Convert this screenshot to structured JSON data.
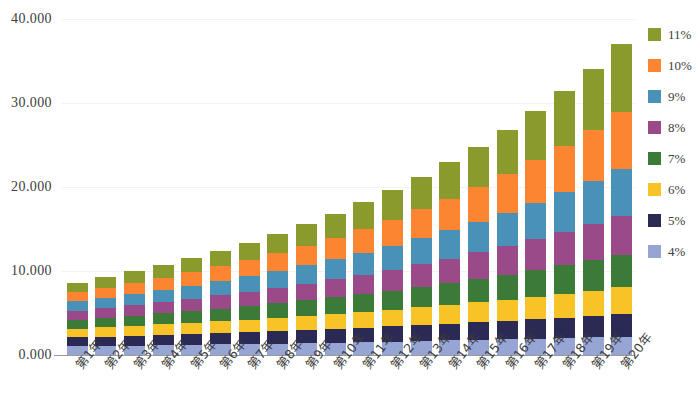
{
  "chart_data": {
    "type": "bar",
    "stacked": true,
    "title": "",
    "subtitle": "",
    "xlabel": "",
    "ylabel": "",
    "ylim": [
      0,
      40
    ],
    "ytick_values": [
      0,
      10,
      20,
      30,
      40
    ],
    "ytick_labels": [
      "0.000",
      "10.000",
      "20.000",
      "30.000",
      "40.000"
    ],
    "grid": true,
    "legend_position": "right",
    "categories": [
      "第1年",
      "第2年",
      "第3年",
      "第4年",
      "第5年",
      "第6年",
      "第7年",
      "第8年",
      "第9年",
      "第10年",
      "第11年",
      "第12年",
      "第13年",
      "第14年",
      "第15年",
      "第16年",
      "第17年",
      "第18年",
      "第19年",
      "第20年"
    ],
    "series": [
      {
        "name": "4%",
        "color": "#97a5d4",
        "values": [
          1.04,
          1.082,
          1.125,
          1.17,
          1.217,
          1.265,
          1.316,
          1.369,
          1.423,
          1.48,
          1.539,
          1.601,
          1.665,
          1.732,
          1.801,
          1.873,
          1.948,
          2.026,
          2.107,
          2.191
        ]
      },
      {
        "name": "5%",
        "color": "#2b2a55",
        "values": [
          1.05,
          1.103,
          1.158,
          1.216,
          1.276,
          1.34,
          1.407,
          1.477,
          1.551,
          1.629,
          1.71,
          1.796,
          1.886,
          1.98,
          2.079,
          2.183,
          2.292,
          2.407,
          2.527,
          2.653
        ]
      },
      {
        "name": "6%",
        "color": "#f7c327",
        "values": [
          1.06,
          1.124,
          1.191,
          1.262,
          1.338,
          1.419,
          1.504,
          1.594,
          1.689,
          1.791,
          1.898,
          2.012,
          2.133,
          2.261,
          2.397,
          2.54,
          2.693,
          2.854,
          3.026,
          3.207
        ]
      },
      {
        "name": "7%",
        "color": "#3c7a37",
        "values": [
          1.07,
          1.145,
          1.225,
          1.311,
          1.403,
          1.501,
          1.606,
          1.718,
          1.838,
          1.967,
          2.105,
          2.252,
          2.41,
          2.579,
          2.759,
          2.952,
          3.159,
          3.38,
          3.617,
          3.87
        ]
      },
      {
        "name": "8%",
        "color": "#9a4a89",
        "values": [
          1.08,
          1.166,
          1.26,
          1.36,
          1.469,
          1.587,
          1.714,
          1.851,
          1.999,
          2.159,
          2.332,
          2.518,
          2.72,
          2.937,
          3.172,
          3.426,
          3.7,
          3.996,
          4.316,
          4.661
        ]
      },
      {
        "name": "9%",
        "color": "#4a91b7",
        "values": [
          1.09,
          1.188,
          1.295,
          1.412,
          1.539,
          1.677,
          1.828,
          1.993,
          2.172,
          2.367,
          2.58,
          2.813,
          3.066,
          3.342,
          3.642,
          3.97,
          4.328,
          4.717,
          5.142,
          5.604
        ]
      },
      {
        "name": "10%",
        "color": "#fb8530",
        "values": [
          1.1,
          1.21,
          1.331,
          1.464,
          1.611,
          1.772,
          1.949,
          2.144,
          2.358,
          2.594,
          2.853,
          3.138,
          3.452,
          3.797,
          4.177,
          4.595,
          5.054,
          5.56,
          6.116,
          6.727
        ]
      },
      {
        "name": "11%",
        "color": "#8a9a2c",
        "values": [
          1.11,
          1.232,
          1.368,
          1.518,
          1.685,
          1.87,
          2.076,
          2.305,
          2.558,
          2.839,
          3.152,
          3.498,
          3.883,
          4.31,
          4.785,
          5.311,
          5.895,
          6.544,
          7.263,
          8.062
        ]
      }
    ],
    "totals": [
      8.6,
      9.25,
      9.953,
      10.713,
      11.538,
      12.431,
      13.4,
      14.451,
      15.588,
      16.826,
      18.169,
      19.628,
      21.215,
      22.938,
      24.812,
      26.85,
      29.069,
      31.484,
      34.114,
      36.975
    ]
  }
}
